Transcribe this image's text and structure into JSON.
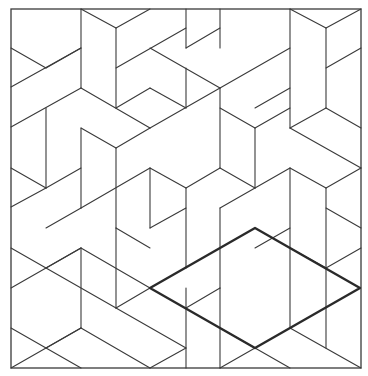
{
  "figure": {
    "width": 368,
    "height": 376,
    "line_color": "#3a3a3a",
    "bold_color": "#2a2a2a",
    "background": "#ffffff",
    "border": {
      "x1": 11,
      "y1": 9,
      "x2": 361,
      "y2": 368
    },
    "highlight_rhombus": [
      [
        150,
        288
      ],
      [
        255,
        228
      ],
      [
        360,
        288
      ],
      [
        255,
        348
      ]
    ],
    "segments": [
      [
        81,
        9,
        81,
        88
      ],
      [
        81,
        9,
        116,
        28
      ],
      [
        116,
        28,
        150,
        9
      ],
      [
        116,
        28,
        116,
        108
      ],
      [
        11,
        48,
        46,
        68
      ],
      [
        46,
        68,
        81,
        48
      ],
      [
        11,
        87,
        81,
        48
      ],
      [
        81,
        88,
        150,
        128
      ],
      [
        11,
        127,
        81,
        88
      ],
      [
        116,
        68,
        186,
        28
      ],
      [
        150,
        48,
        220,
        88
      ],
      [
        186,
        9,
        186,
        48
      ],
      [
        220,
        9,
        220,
        48
      ],
      [
        186,
        48,
        220,
        28
      ],
      [
        220,
        88,
        290,
        48
      ],
      [
        290,
        9,
        290,
        128
      ],
      [
        290,
        9,
        326,
        28
      ],
      [
        326,
        28,
        361,
        9
      ],
      [
        326,
        28,
        326,
        108
      ],
      [
        326,
        68,
        361,
        48
      ],
      [
        116,
        108,
        150,
        88
      ],
      [
        150,
        88,
        186,
        108
      ],
      [
        150,
        128,
        220,
        88
      ],
      [
        186,
        68,
        186,
        108
      ],
      [
        220,
        88,
        220,
        168
      ],
      [
        255,
        108,
        290,
        88
      ],
      [
        220,
        108,
        255,
        128
      ],
      [
        290,
        128,
        326,
        108
      ],
      [
        326,
        108,
        361,
        128
      ],
      [
        290,
        128,
        361,
        168
      ],
      [
        255,
        128,
        255,
        188
      ],
      [
        255,
        128,
        290,
        108
      ],
      [
        46,
        108,
        46,
        188
      ],
      [
        11,
        168,
        46,
        188
      ],
      [
        46,
        188,
        81,
        168
      ],
      [
        81,
        128,
        81,
        208
      ],
      [
        81,
        208,
        150,
        168
      ],
      [
        46,
        228,
        81,
        208
      ],
      [
        11,
        207,
        46,
        188
      ],
      [
        116,
        148,
        116,
        228
      ],
      [
        116,
        148,
        150,
        128
      ],
      [
        81,
        128,
        116,
        148
      ],
      [
        150,
        168,
        186,
        188
      ],
      [
        186,
        188,
        220,
        168
      ],
      [
        150,
        168,
        150,
        228
      ],
      [
        116,
        228,
        150,
        248
      ],
      [
        186,
        188,
        186,
        268
      ],
      [
        150,
        228,
        186,
        208
      ],
      [
        220,
        168,
        255,
        188
      ],
      [
        255,
        188,
        290,
        168
      ],
      [
        290,
        168,
        290,
        248
      ],
      [
        290,
        168,
        326,
        188
      ],
      [
        326,
        188,
        361,
        168
      ],
      [
        326,
        188,
        326,
        268
      ],
      [
        326,
        208,
        361,
        228
      ],
      [
        220,
        208,
        255,
        188
      ],
      [
        220,
        208,
        220,
        288
      ],
      [
        11,
        248,
        46,
        268
      ],
      [
        46,
        268,
        81,
        248
      ],
      [
        11,
        288,
        81,
        248
      ],
      [
        81,
        248,
        81,
        328
      ],
      [
        81,
        248,
        150,
        288
      ],
      [
        116,
        228,
        116,
        308
      ],
      [
        116,
        308,
        150,
        288
      ],
      [
        46,
        268,
        116,
        308
      ],
      [
        11,
        328,
        46,
        348
      ],
      [
        46,
        348,
        81,
        328
      ],
      [
        11,
        368,
        81,
        328
      ],
      [
        81,
        328,
        150,
        368
      ],
      [
        46,
        348,
        81,
        368
      ],
      [
        116,
        308,
        186,
        348
      ],
      [
        186,
        288,
        186,
        368
      ],
      [
        150,
        368,
        186,
        348
      ],
      [
        186,
        308,
        220,
        288
      ],
      [
        220,
        288,
        220,
        368
      ],
      [
        220,
        328,
        255,
        348
      ],
      [
        255,
        248,
        290,
        228
      ],
      [
        290,
        248,
        326,
        268
      ],
      [
        290,
        248,
        290,
        328
      ],
      [
        326,
        268,
        361,
        248
      ],
      [
        255,
        348,
        220,
        368
      ],
      [
        255,
        348,
        290,
        368
      ],
      [
        290,
        328,
        361,
        368
      ],
      [
        326,
        268,
        326,
        348
      ]
    ]
  }
}
